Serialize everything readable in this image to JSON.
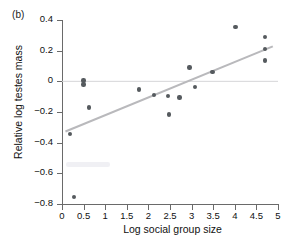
{
  "panel": {
    "label": "(b)"
  },
  "chart_data": {
    "type": "scatter",
    "title": "",
    "xlabel": "Log social group size",
    "ylabel": "Relative log testes mass",
    "xlim": [
      0,
      5
    ],
    "ylim": [
      -0.8,
      0.4
    ],
    "xticks": [
      0,
      0.5,
      1,
      1.5,
      2,
      2.5,
      3,
      3.5,
      4,
      4.5,
      5
    ],
    "xtick_labels": [
      "0",
      "0.5",
      "1",
      "1.5",
      "2",
      "2.5",
      "3",
      "3.5",
      "4",
      "4.5",
      "5"
    ],
    "yticks": [
      0.4,
      0.2,
      0,
      -0.2,
      -0.4,
      -0.6,
      -0.8
    ],
    "ytick_labels": [
      "0.4",
      "0.2",
      "0",
      "−0.2",
      "−0.4",
      "−0.6",
      "−0.8"
    ],
    "grid": false,
    "legend": null,
    "marker_color": "#555a5e",
    "line_color": "#b9b9bc",
    "reference_line_color": "#d5d5d8",
    "points": [
      {
        "x": 0.18,
        "y": -0.345
      },
      {
        "x": 0.28,
        "y": -0.755
      },
      {
        "x": 0.5,
        "y": 0.005
      },
      {
        "x": 0.5,
        "y": -0.02
      },
      {
        "x": 0.62,
        "y": -0.17
      },
      {
        "x": 1.78,
        "y": -0.052
      },
      {
        "x": 2.13,
        "y": -0.09
      },
      {
        "x": 2.45,
        "y": -0.095
      },
      {
        "x": 2.48,
        "y": -0.215
      },
      {
        "x": 2.72,
        "y": -0.105
      },
      {
        "x": 2.95,
        "y": 0.09
      },
      {
        "x": 3.08,
        "y": -0.035
      },
      {
        "x": 3.48,
        "y": 0.06
      },
      {
        "x": 4.02,
        "y": 0.355
      },
      {
        "x": 4.7,
        "y": 0.29
      },
      {
        "x": 4.7,
        "y": 0.21
      },
      {
        "x": 4.7,
        "y": 0.135
      }
    ],
    "fit_line": {
      "x0": 0.08,
      "y0": -0.327,
      "x1": 4.88,
      "y1": 0.228
    },
    "reference_line": {
      "y": 0.0,
      "x0": 0.0,
      "x1": 5.0
    }
  }
}
